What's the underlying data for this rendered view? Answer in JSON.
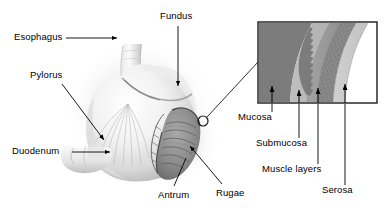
{
  "figure": {
    "background_color": "#ffffff",
    "line_color": "#000000",
    "width": 386,
    "height": 211
  },
  "organ_labels": [
    {
      "id": "esophagus",
      "text": "Esophagus",
      "x": 14,
      "y": 34,
      "leader": "horizontal-arrow-right"
    },
    {
      "id": "fundus",
      "text": "Fundus",
      "x": 160,
      "y": 12,
      "leader": "vertical-arrow-down"
    },
    {
      "id": "pylorus",
      "text": "Pylorus",
      "x": 30,
      "y": 72,
      "leader": "diagonal-arrow-down-right"
    },
    {
      "id": "duodenum",
      "text": "Duodenum",
      "x": 12,
      "y": 147,
      "leader": "horizontal-arrow-right"
    },
    {
      "id": "antrum",
      "text": "Antrum",
      "x": 158,
      "y": 191,
      "leader": "diagonal-line-up-right"
    },
    {
      "id": "rugae",
      "text": "Rugae",
      "x": 215,
      "y": 189,
      "leader": "diagonal-arrow-up-left"
    }
  ],
  "inset": {
    "name": "gastric-wall-layers",
    "box": {
      "x": 258,
      "y": 22,
      "width": 119,
      "height": 81
    },
    "border_color": "#1a1a1a",
    "layers": [
      {
        "id": "lumen",
        "label": "Lumen",
        "color": "#7a7a7a"
      },
      {
        "id": "mucosa",
        "label": "Mucosa",
        "color": "#b9b9b9"
      },
      {
        "id": "submucosa",
        "label": "Submucosa",
        "color": "#9a9a9a"
      },
      {
        "id": "muscle",
        "label": "Muscle layers",
        "color": "#8e8e8e"
      },
      {
        "id": "serosa",
        "label": "Serosa",
        "color": "#c9c9c9"
      },
      {
        "id": "outer",
        "label": "Outer",
        "color": "#ffffff"
      }
    ]
  },
  "inset_labels": [
    {
      "id": "mucosa",
      "text": "Mucosa",
      "x": 238,
      "y": 113,
      "tick_x": 272,
      "tick_y_end": 104
    },
    {
      "id": "submucosa",
      "text": "Submucosa",
      "x": 257,
      "y": 139,
      "tick_x": 299,
      "tick_y_end": 104
    },
    {
      "id": "muscle-layers",
      "text": "Muscle layers",
      "x": 270,
      "y": 165,
      "tick_x": 318,
      "tick_y_end": 104
    },
    {
      "id": "serosa",
      "text": "Serosa",
      "x": 327,
      "y": 186,
      "tick_x": 345,
      "tick_y_end": 104
    }
  ],
  "callout": {
    "name": "magnification-marker",
    "circle_x": 203,
    "circle_y": 121,
    "circle_r": 5,
    "line_to_x": 258,
    "line_to_y": 62
  }
}
